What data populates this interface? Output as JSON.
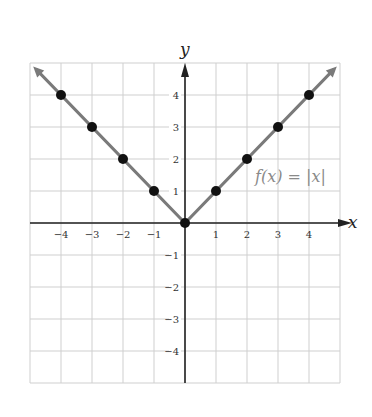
{
  "chart_data": {
    "type": "line",
    "title": "",
    "function_label": "f(x) = |x|",
    "xlabel": "x",
    "ylabel": "y",
    "xlim": [
      -5,
      5
    ],
    "ylim": [
      -5,
      5
    ],
    "grid": true,
    "x_ticks": [
      -4,
      -3,
      -2,
      -1,
      1,
      2,
      3,
      4
    ],
    "y_ticks": [
      4,
      3,
      2,
      1,
      -1,
      -2,
      -3,
      -4
    ],
    "series": [
      {
        "name": "f(x) = |x|",
        "x": [
          -4,
          -3,
          -2,
          -1,
          0,
          1,
          2,
          3,
          4
        ],
        "y": [
          4,
          3,
          2,
          1,
          0,
          1,
          2,
          3,
          4
        ],
        "line_extends_to": [
          [
            -4.8,
            4.8
          ],
          [
            4.8,
            4.8
          ]
        ],
        "line_color": "#7a7a7a",
        "marker_color": "#111111"
      }
    ]
  },
  "colors": {
    "grid": "#cfcfcf",
    "axis": "#222222",
    "line": "#7a7a7a",
    "points": "#111111",
    "label": "#8a8a8a"
  }
}
